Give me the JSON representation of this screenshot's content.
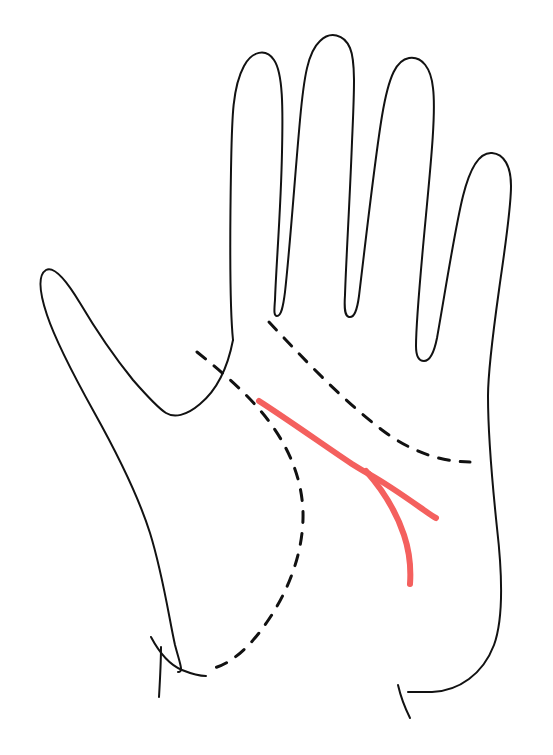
{
  "document": {
    "title": "Palm Reading Diagram",
    "subject": "left-palm-line-illustration",
    "description": "Line drawing of an open left palm showing palm creases; the fate/destiny line is highlighted in red with a fork near its lower end.",
    "canvas": {
      "width": 553,
      "height": 755
    },
    "background_color": "#ffffff"
  },
  "style": {
    "outline_color": "#121212",
    "outline_width": 2.0,
    "dashed_color": "#111111",
    "dashed_width": 3.0,
    "dash_pattern": "11 11",
    "highlight_color": "#f4605e",
    "highlight_width": 6.0
  },
  "legend": {
    "outline_label": "hand outline",
    "dashed_label": "secondary palm creases",
    "highlight_label": "highlighted line"
  },
  "anatomy": {
    "fingertips": [
      {
        "name": "index-finger-tip",
        "x": 250,
        "y": 55
      },
      {
        "name": "middle-finger-tip",
        "x": 340,
        "y": 35
      },
      {
        "name": "ring-finger-tip",
        "x": 425,
        "y": 62
      },
      {
        "name": "pinky-finger-tip",
        "x": 492,
        "y": 155
      },
      {
        "name": "thumb-tip",
        "x": 55,
        "y": 266
      }
    ],
    "valleys": [
      {
        "name": "index-middle-valley",
        "x": 277,
        "y": 315
      },
      {
        "name": "middle-ring-valley",
        "x": 359,
        "y": 318
      },
      {
        "name": "ring-pinky-valley",
        "x": 440,
        "y": 357
      },
      {
        "name": "thumb-index-web",
        "x": 166,
        "y": 413
      }
    ],
    "wrist": [
      {
        "name": "wrist-left",
        "x": 178,
        "y": 672
      },
      {
        "name": "wrist-right",
        "x": 408,
        "y": 692
      }
    ]
  },
  "paths": {
    "hand_outline": {
      "name": "hand-outline",
      "d": "M 233 340 C 229 300 230 230 231 170 C 232 120 232 88 244 66 C 252 51 266 48 274 60 C 283 73 283 108 282 152 C 281 208 276 268 275 300 C 274 312 274 316 277 316 C 281 316 283 308 285 292 C 290 247 295 175 300 120 C 304 76 308 52 320 41 C 330 31 344 34 350 48 C 356 62 354 95 352 142 C 350 196 346 262 345 295 C 344 310 345 316 349 317 C 354 318 357 311 359 296 C 366 238 375 158 382 116 C 389 74 397 60 409 58 C 422 56 431 68 433 88 C 436 112 431 162 426 215 C 420 278 416 330 416 346 C 416 357 419 361 424 361 C 430 361 434 353 437 338 C 446 287 455 228 463 196 C 471 164 481 152 492 153 C 504 154 511 166 511 186 C 511 210 504 254 499 290 C 492 340 488 372 488 396 C 488 440 493 490 497 528 C 503 580 503 620 494 645 C 483 674 459 691 432 692 L 408 692",
      "description": "four fingers plus right palm edge down to the right wrist"
    },
    "hand_outline_left": {
      "name": "hand-outline-left-thumb",
      "d": "M 233 340 C 228 366 217 390 200 404 C 186 416 174 418 166 413 C 158 408 147 396 133 380 C 112 354 93 325 80 303 C 65 278 53 266 46 270 C 38 275 39 291 47 315 C 56 342 74 376 94 412 C 118 455 138 495 150 533 C 163 575 169 618 175 645 C 180 664 184 672 178 672",
      "description": "thumb and left outer edge of palm"
    },
    "palm_left_lower": {
      "name": "palm-left-lower-edge",
      "d": "M 151 637 C 160 654 170 665 182 670 C 192 674 200 676 206 676",
      "description": "lower left palm edge joining the wrist"
    },
    "wrist_tick_left": {
      "name": "wrist-crease-tick-left",
      "d": "M 161 647 C 161 662 160 680 159 697",
      "description": "short vertical tick at left wrist"
    },
    "wrist_tick_right": {
      "name": "wrist-crease-tick-right",
      "d": "M 398 685 C 401 698 405 708 410 718",
      "description": "short vertical tick at right wrist"
    },
    "heart_line": {
      "name": "heart-line-dashed",
      "d": "M 269 322 C 300 355 340 398 382 430 C 410 451 440 462 470 462",
      "description": "upper dashed crease running from between index and middle fingers toward the right palm edge"
    },
    "head_line": {
      "name": "head-line-dashed",
      "d": "M 197 352 C 222 372 248 394 268 420 C 290 449 302 480 303 512 C 304 552 288 592 267 622 C 248 650 229 664 214 668",
      "description": "dashed crease arcing from the thumb web around the ball of the thumb to the wrist"
    },
    "fate_line_main": {
      "name": "fate-line-highlight-main",
      "d": "M 259 401 C 290 421 325 446 352 464 C 360 469 365 472 369 474",
      "description": "main red highlighted line descending from the upper palm"
    },
    "fate_line_branch_up": {
      "name": "fate-line-highlight-branch-upper",
      "d": "M 369 474 C 385 483 404 496 421 508 C 428 513 432 516 436 518",
      "description": "upper fork of the red line running down-right"
    },
    "fate_line_branch_down": {
      "name": "fate-line-highlight-branch-lower",
      "d": "M 366 471 C 382 489 396 511 404 535 C 410 553 411 570 410 584",
      "description": "lower fork of the red line curving down to end near the wrist"
    }
  }
}
